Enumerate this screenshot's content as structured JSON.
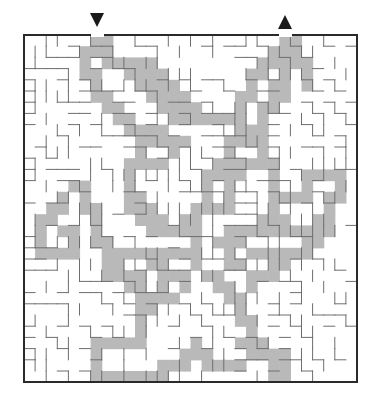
{
  "puzzle": {
    "type": "maze",
    "state": "solved",
    "colors": {
      "background": "#ffffff",
      "solution_path": "#b9b9b9",
      "walls": "#6e6e6e",
      "border": "#2a2a2a",
      "markers": "#1a1a1a"
    },
    "grid": {
      "cols": 30,
      "rows": 31,
      "origin_x": 24,
      "origin_y": 35,
      "cell_w": 11.1,
      "cell_h": 11.2
    },
    "entrance": {
      "icon": "down-triangle-icon",
      "col": 6,
      "x": 97
    },
    "exit": {
      "icon": "up-triangle-icon",
      "col": 23,
      "x": 285
    },
    "solution_rows": [
      "......##...............##.....",
      ".....###..............###.....",
      ".....#.#####.........#####....",
      ".....##..####.......##.#.#....",
      "......#...####......#.##.#....",
      "......##...####....##.##......",
      ".......##...####...#.##.......",
      "........##...#######.#........",
      ".........####......###........",
      "..........#####...####........",
      "..........#..#....#..#........",
      ".........####....######.......",
      ".........#......####..#..####.",
      "....##...#......#.#...#..#..#.",
      "...#.#...##.....#.#...####.##.",
      "..##.##..###...####...#....#..",
      ".##...#...###.##.....###..##..",
      ".#.##.#....#####..##########..",
      ".#..#.##.......#.###.....##...",
      ".####..#########..#.######....",
      ".......##..##..#..##..##......",
      ".......####.###.##..###.......",
      ".........##.#.#..##.#.........",
      "..........####....##..........",
      "..........##.......#..........",
      "..........#........##.........",
      "..........#.........#.........",
      "......#####....#...###........",
      "......#.......###...####......",
      "......#.....###.####..##......",
      "......#######.........##......"
    ]
  }
}
